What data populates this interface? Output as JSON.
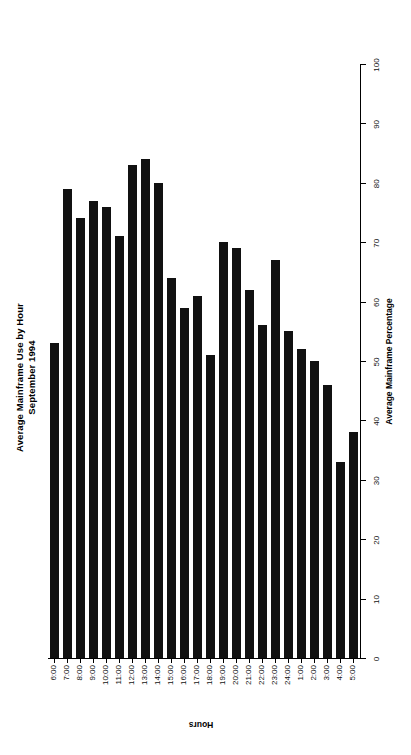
{
  "chart_data": {
    "type": "bar",
    "orientation": "horizontal",
    "title": "Average Mainframe Use by Hour",
    "subtitle": "September 1994",
    "xlabel": "Hours",
    "ylabel": "Average Mainframe Percentage",
    "ylim": [
      0,
      100
    ],
    "ytick_labels": [
      "0",
      "10",
      "20",
      "30",
      "40",
      "50",
      "60",
      "70",
      "80",
      "90",
      "100"
    ],
    "ytick_values": [
      0,
      10,
      20,
      30,
      40,
      50,
      60,
      70,
      80,
      90,
      100
    ],
    "grid": false,
    "legend": false,
    "bar_color": "#111111",
    "categories": [
      "6:00",
      "7:00",
      "8:00",
      "9:00",
      "10:00",
      "11:00",
      "12:00",
      "13:00",
      "14:00",
      "15:00",
      "16:00",
      "17:00",
      "18:00",
      "19:00",
      "20:00",
      "21:00",
      "22:00",
      "23:00",
      "24:00",
      "1:00",
      "2:00",
      "3:00",
      "4:00",
      "5:00"
    ],
    "values": [
      53,
      79,
      74,
      77,
      76,
      71,
      83,
      84,
      80,
      64,
      59,
      61,
      51,
      70,
      69,
      62,
      56,
      67,
      55,
      52,
      50,
      46,
      33,
      38
    ]
  },
  "axis": {
    "category_title": "Hours",
    "value_title": "Average Mainframe Percentage"
  }
}
